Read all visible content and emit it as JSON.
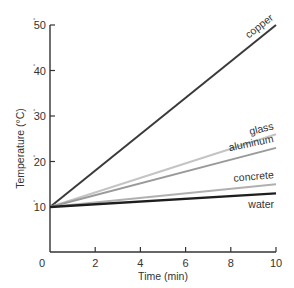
{
  "chart_data": {
    "type": "line",
    "title": "",
    "xlabel": "Time (min)",
    "ylabel": "Temperature (°C)",
    "xlim": [
      0,
      10
    ],
    "ylim": [
      0,
      50
    ],
    "x_ticks": [
      "0",
      "2",
      "4",
      "6",
      "8",
      "10"
    ],
    "y_ticks": [
      "10",
      "20",
      "30",
      "40",
      "50"
    ],
    "grid": false,
    "legend": "inline labels at line ends",
    "x": [
      0,
      10
    ],
    "series": [
      {
        "name": "copper",
        "values": [
          10,
          50
        ],
        "color": "#3a3a3a"
      },
      {
        "name": "glass",
        "values": [
          10,
          26
        ],
        "color": "#c4c4c4"
      },
      {
        "name": "aluminum",
        "values": [
          10,
          23
        ],
        "color": "#9a9a9a"
      },
      {
        "name": "concrete",
        "values": [
          10,
          15
        ],
        "color": "#b0b0b0"
      },
      {
        "name": "water",
        "values": [
          10,
          13
        ],
        "color": "#1e1e1e"
      }
    ]
  }
}
